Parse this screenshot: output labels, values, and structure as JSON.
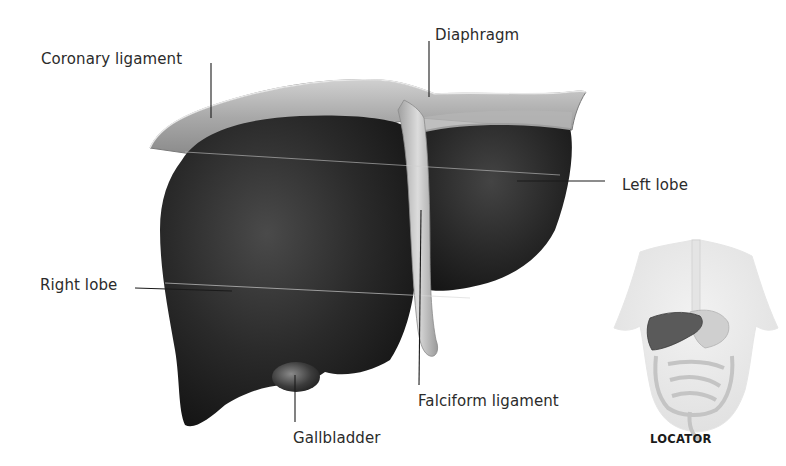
{
  "figure": {
    "labels": {
      "coronary_ligament": "Coronary ligament",
      "diaphragm": "Diaphragm",
      "left_lobe": "Left lobe",
      "right_lobe": "Right lobe",
      "falciform_ligament": "Falciform ligament",
      "gallbladder": "Gallbladder"
    },
    "locator": {
      "label": "LOCATOR"
    }
  },
  "colors": {
    "liver_dark": "#1e1e1e",
    "liver_mid": "#3a3a3a",
    "ligament_light": "#c8c8c8",
    "diaphragm_band": "#9a9a9a",
    "label_text": "#2b2b2b",
    "leader_line": "#1a1a1a"
  }
}
